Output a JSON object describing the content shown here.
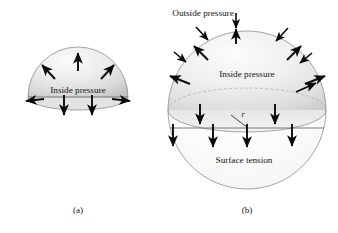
{
  "figure": {
    "background_color": "#ffffff",
    "ink_color": "#141414",
    "shade_light": "#f4f4f4",
    "shade_mid": "#dcdcdc",
    "shade_dark": "#c4c4c4",
    "outline_color": "#8e8e8e"
  },
  "panel_a": {
    "caption": "(a)",
    "labels": {
      "inside_pressure": "Inside pressure"
    },
    "arrow_groups": [
      {
        "name": "outward-pressure-arrows",
        "count": 3,
        "direction": "outward-radial",
        "description": "arrows pointing outward from dome surface"
      },
      {
        "name": "rim-horizontal-arrows",
        "count": 2,
        "direction": "horizontal-outward",
        "description": "arrows at the rim pointing left and right"
      },
      {
        "name": "surface-tension-arrows",
        "count": 2,
        "direction": "down",
        "description": "downward arrows below the cut plane"
      }
    ]
  },
  "panel_b": {
    "caption": "(b)",
    "labels": {
      "outside_pressure": "Outside pressure",
      "inside_pressure": "Inside pressure",
      "surface_tension": "Surface tension",
      "radius": "r"
    },
    "arrow_groups": [
      {
        "name": "outside-pressure-arrows",
        "count": 6,
        "direction": "inward-radial",
        "description": "arrows pointing inward toward the sphere surface"
      },
      {
        "name": "inside-pressure-arrows",
        "count": 6,
        "direction": "outward-radial",
        "description": "arrows pointing outward from the sphere surface"
      },
      {
        "name": "surface-tension-arrows",
        "count": 4,
        "direction": "down",
        "description": "downward arrows through the equatorial cut plane"
      }
    ]
  }
}
